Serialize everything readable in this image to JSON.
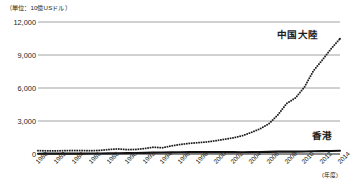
{
  "unit_label": "（単位：10億USドル）",
  "axis_note": "(年度)",
  "series_labels": {
    "china": "中国大陸",
    "hongkong": "香港"
  },
  "colors": {
    "china_line": "#1a1a1a",
    "hongkong_line": "#111111",
    "gridline": "#8c8c8c",
    "axis": "#1a1a1a",
    "text": "#231f20",
    "background": "#ffffff"
  },
  "chart_data": {
    "type": "line",
    "title": "",
    "subtitle": "",
    "xlabel": "(年度)",
    "ylabel": "（単位：10億USドル）",
    "ylim": [
      0,
      12000
    ],
    "xlim": [
      1980,
      2014
    ],
    "grid": true,
    "legend_position": "inline-right",
    "ytick_labels": [
      "12,000",
      "9,000",
      "6,000",
      "3,000",
      "0"
    ],
    "ytick_values": [
      12000,
      9000,
      6000,
      3000,
      0
    ],
    "xtick_labels": [
      "1980",
      "1982",
      "1984",
      "1986",
      "1988",
      "1990",
      "1992",
      "1994",
      "1996",
      "1998",
      "2000",
      "2002",
      "2004",
      "2006",
      "2008",
      "2010",
      "2012",
      "2014"
    ],
    "x": [
      1980,
      1981,
      1982,
      1983,
      1984,
      1985,
      1986,
      1987,
      1988,
      1989,
      1990,
      1991,
      1992,
      1993,
      1994,
      1995,
      1996,
      1997,
      1998,
      1999,
      2000,
      2001,
      2002,
      2003,
      2004,
      2005,
      2006,
      2007,
      2008,
      2009,
      2010,
      2011,
      2012,
      2013,
      2014
    ],
    "series": [
      {
        "name": "中国大陸",
        "style": "dotted",
        "values": [
          303,
          289,
          284,
          305,
          314,
          310,
          300,
          327,
          409,
          459,
          398,
          413,
          494,
          618,
          564,
          734,
          863,
          962,
          1029,
          1094,
          1205,
          1339,
          1471,
          1660,
          1955,
          2286,
          2752,
          3550,
          4594,
          5102,
          6087,
          7552,
          8532,
          9570,
          10480
        ]
      },
      {
        "name": "香港",
        "style": "solid",
        "values": [
          29,
          31,
          33,
          30,
          34,
          36,
          41,
          51,
          60,
          69,
          77,
          89,
          105,
          121,
          136,
          145,
          160,
          177,
          169,
          166,
          172,
          170,
          167,
          162,
          170,
          182,
          194,
          212,
          220,
          215,
          229,
          249,
          263,
          276,
          291
        ]
      }
    ]
  }
}
